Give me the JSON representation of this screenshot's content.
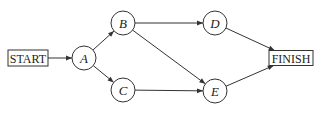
{
  "diagram": {
    "type": "activity-network",
    "nodes": [
      {
        "id": "START",
        "label": "START",
        "shape": "box"
      },
      {
        "id": "A",
        "label": "A",
        "shape": "circle"
      },
      {
        "id": "B",
        "label": "B",
        "shape": "circle"
      },
      {
        "id": "C",
        "label": "C",
        "shape": "circle"
      },
      {
        "id": "D",
        "label": "D",
        "shape": "circle"
      },
      {
        "id": "E",
        "label": "E",
        "shape": "circle"
      },
      {
        "id": "FINISH",
        "label": "FINISH",
        "shape": "box"
      }
    ],
    "edges": [
      {
        "from": "START",
        "to": "A"
      },
      {
        "from": "A",
        "to": "B"
      },
      {
        "from": "A",
        "to": "C"
      },
      {
        "from": "B",
        "to": "D"
      },
      {
        "from": "B",
        "to": "E"
      },
      {
        "from": "C",
        "to": "E"
      },
      {
        "from": "D",
        "to": "FINISH"
      },
      {
        "from": "E",
        "to": "FINISH"
      }
    ],
    "colors": {
      "stroke": "#333333",
      "text": "#222222",
      "background": "#ffffff"
    }
  }
}
